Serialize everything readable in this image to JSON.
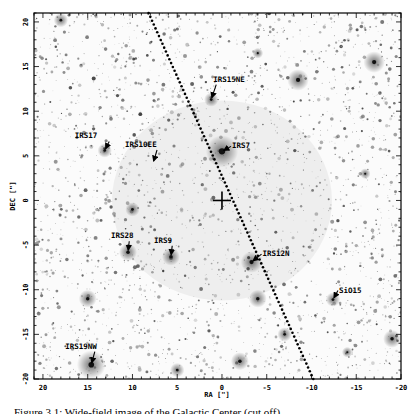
{
  "figure": {
    "type": "astronomical-image",
    "xlabel": "RA [\"]",
    "ylabel": "DEC [\"]",
    "x_ticks": [
      "20",
      "15",
      "10",
      "5",
      "0",
      "-5",
      "-10",
      "-15",
      "-20"
    ],
    "y_ticks": [
      "20",
      "15",
      "10",
      "5",
      "0",
      "-5",
      "-10",
      "-15",
      "-20"
    ],
    "xlim": [
      21,
      -20
    ],
    "ylim": [
      -20,
      21
    ],
    "center_marker": "cross-at-origin",
    "galactic_plane_line": "dotted",
    "sources": [
      {
        "name": "IRS15NE",
        "ra": 1.2,
        "dec": 11.3
      },
      {
        "name": "IRS17",
        "ra": 13.1,
        "dec": 5.6
      },
      {
        "name": "IRS10EE",
        "ra": 7.7,
        "dec": 4.2
      },
      {
        "name": "IRS7",
        "ra": 0.0,
        "dec": 5.5
      },
      {
        "name": "IRS28",
        "ra": 10.5,
        "dec": -5.8
      },
      {
        "name": "IRS9",
        "ra": 5.7,
        "dec": -6.3
      },
      {
        "name": "IRS12N",
        "ra": -3.3,
        "dec": -6.9
      },
      {
        "name": "SiO15",
        "ra": -12.4,
        "dec": -11.1
      },
      {
        "name": "IRS19NW",
        "ra": 14.6,
        "dec": -18.4
      }
    ]
  },
  "caption": "Figure 3.1: Wide-field image of the Galactic Center (cut off)"
}
